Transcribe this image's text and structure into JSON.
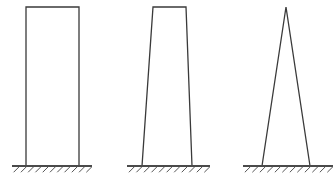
{
  "canvas": {
    "width": 336,
    "height": 189,
    "background_color": "#ffffff",
    "stroke_color": "#3a3a3a",
    "ground_color": "#4a4a4a",
    "hatch_color": "#555555"
  },
  "diagram": {
    "title": "",
    "caption": "",
    "type": "structural-frame-sketch",
    "figure_count": 3
  },
  "figures": [
    {
      "id": "figure-1",
      "name": "rectangular-frame",
      "label": "",
      "shape": "rectangle",
      "stroke_width": 1.3,
      "geometry": {
        "top_left": [
          26,
          7
        ],
        "top_right": [
          79,
          7
        ],
        "base_left": [
          26,
          166
        ],
        "base_right": [
          79,
          166
        ],
        "top_width": 53,
        "base_width": 53,
        "height": 159
      },
      "ground": {
        "line_start": [
          12,
          166
        ],
        "line_end": [
          92,
          166
        ],
        "line_width": 2.2,
        "hatch_count": 11,
        "hatch_length": 8,
        "hatch_angle_deg": 45,
        "hatch_spacing": 7.2
      }
    },
    {
      "id": "figure-2",
      "name": "tapered-trapezoidal-frame",
      "label": "",
      "shape": "trapezoid",
      "stroke_width": 1.3,
      "geometry": {
        "top_left": [
          153,
          7
        ],
        "top_right": [
          186,
          7
        ],
        "base_left": [
          142,
          166
        ],
        "base_right": [
          192,
          166
        ],
        "top_width": 33,
        "base_width": 50,
        "height": 159
      },
      "ground": {
        "line_start": [
          127,
          166
        ],
        "line_end": [
          210,
          166
        ],
        "line_width": 2.2,
        "hatch_count": 11,
        "hatch_length": 8,
        "hatch_angle_deg": 45,
        "hatch_spacing": 7.5
      }
    },
    {
      "id": "figure-3",
      "name": "triangular-a-frame",
      "label": "",
      "shape": "triangle",
      "stroke_width": 1.3,
      "geometry": {
        "apex": [
          286,
          7
        ],
        "base_left": [
          262,
          166
        ],
        "base_right": [
          310,
          166
        ],
        "top_width": 0,
        "base_width": 48,
        "height": 159
      },
      "ground": {
        "line_start": [
          243,
          166
        ],
        "line_end": [
          333,
          166
        ],
        "line_width": 2.2,
        "hatch_count": 12,
        "hatch_length": 8,
        "hatch_angle_deg": 45,
        "hatch_spacing": 7.5
      }
    }
  ]
}
